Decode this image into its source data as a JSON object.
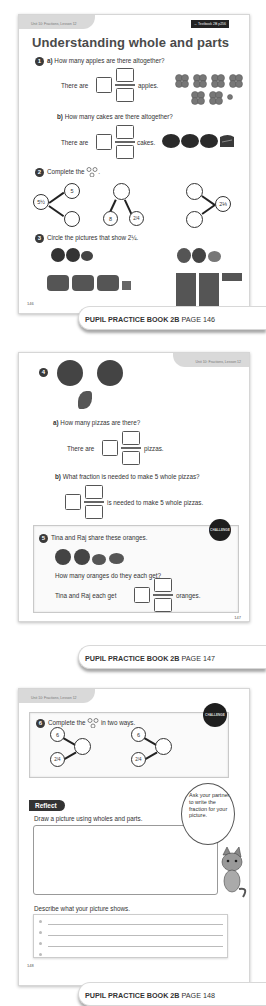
{
  "page146": {
    "unit_tag": "Unit 10: Fractions, Lesson 12",
    "textbook_ref": "→ Textbook 2B p256",
    "title": "Understanding whole and parts",
    "q1": {
      "number": "1",
      "a_label": "a)",
      "a_question": "How many apples are there altogether?",
      "a_sentence_start": "There are",
      "a_sentence_end": "apples.",
      "b_label": "b)",
      "b_question": "How many cakes are there altogether?",
      "b_sentence_start": "There are",
      "b_sentence_end": "cakes."
    },
    "q2": {
      "number": "2",
      "prompt": "Complete the",
      "prompt_end": ".",
      "bond1": {
        "whole": "5½",
        "part1": "5",
        "part2": ""
      },
      "bond2": {
        "whole": "",
        "part1": "8",
        "part2": "2/4"
      },
      "bond3": {
        "whole": "2⅓",
        "part1": "",
        "part2": ""
      }
    },
    "q3": {
      "number": "3",
      "prompt": "Circle the pictures that show 2¼."
    },
    "page_number": "146",
    "ribbon": {
      "book": "PUPIL PRACTICE BOOK 2B",
      "page": "PAGE 146"
    }
  },
  "page147": {
    "unit_tag": "Unit 10: Fractions, Lesson 12",
    "q4": {
      "number": "4",
      "a_label": "a)",
      "a_question": "How many pizzas are there?",
      "a_sentence_start": "There are",
      "a_sentence_end": "pizzas.",
      "b_label": "b)",
      "b_question": "What fraction is needed to make 5 whole pizzas?",
      "b_sentence_end": "is needed to make 5 whole pizzas."
    },
    "q5": {
      "number": "5",
      "badge": "CHALLENGE",
      "prompt": "Tina and Raj share these oranges.",
      "question": "How many oranges do they each get?",
      "sentence_start": "Tina and Raj each get",
      "sentence_end": "oranges."
    },
    "page_number": "147",
    "ribbon": {
      "book": "PUPIL PRACTICE BOOK 2B",
      "page": "PAGE 147"
    }
  },
  "page148": {
    "unit_tag": "Unit 10: Fractions, Lesson 12",
    "q6": {
      "number": "6",
      "badge": "CHALLENGE",
      "prompt": "Complete the",
      "prompt_end": "in two ways.",
      "bond1": {
        "part1": "6",
        "part2": "2/4",
        "whole": ""
      },
      "bond2": {
        "part1": "6",
        "part2": "2/4",
        "whole": ""
      }
    },
    "reflect": {
      "tag": "Reflect",
      "prompt": "Draw a picture using wholes and parts.",
      "speech": "Ask your partner to write the fraction for your picture.",
      "describe": "Describe what your picture shows."
    },
    "page_number": "148",
    "ribbon": {
      "book": "PUPIL PRACTICE BOOK 2B",
      "page": "PAGE 148"
    }
  }
}
